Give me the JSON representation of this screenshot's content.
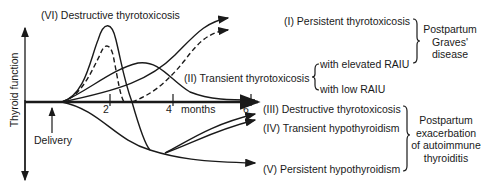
{
  "diagram": {
    "axes": {
      "y_label": "Thyroid function",
      "x_unit": "months",
      "x_ticks": [
        "2",
        "4",
        "6"
      ],
      "delivery_label": "Delivery"
    },
    "curve_labels": {
      "vi": "(VI) Destructive thyrotoxicosis",
      "i": "(I) Persistent thyrotoxicosis",
      "ii": "(II) Transient thyrotoxicosis",
      "ii_a": "with elevated RAIU",
      "ii_b": "with low RAIU",
      "iii": "(III) Destructive thyrotoxicosis",
      "iv": "(IV) Transient hypothyroidism",
      "v": "(V) Persistent hypothyroidism"
    },
    "groups": {
      "graves": [
        "Postpartum",
        "Graves'",
        "disease"
      ],
      "autoimmune": [
        "Postpartum",
        "exacerbation",
        "of autoimmune",
        "thyroiditis"
      ]
    }
  }
}
